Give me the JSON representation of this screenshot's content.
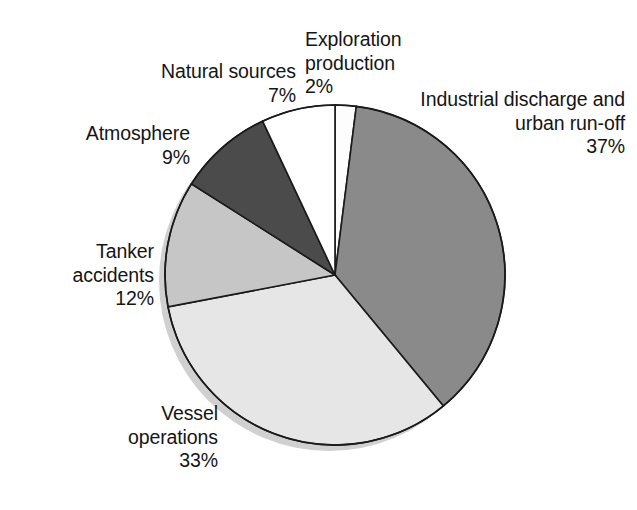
{
  "chart_data": {
    "type": "pie",
    "title": "",
    "subtitle": "",
    "xlabel": "",
    "ylabel": "",
    "grid": false,
    "legend_position": "none",
    "label_format": "name + percent",
    "start_angle_deg": 0,
    "direction": "clockwise",
    "units": "percent",
    "categories": [
      "Exploration production",
      "Industrial discharge and urban run-off",
      "Vessel operations",
      "Tanker accidents",
      "Atmosphere",
      "Natural sources"
    ],
    "values": [
      2,
      37,
      33,
      12,
      9,
      7
    ],
    "slices": [
      {
        "id": "exploration",
        "name_lines": [
          "Exploration",
          "production"
        ],
        "percent_text": "2%",
        "value": 2,
        "color": "#fdfdfd",
        "start_deg": 0,
        "end_deg": 7.2
      },
      {
        "id": "industrial",
        "name_lines": [
          "Industrial discharge and",
          "urban run-off"
        ],
        "percent_text": "37%",
        "value": 37,
        "color": "#8a8a8a",
        "start_deg": 7.2,
        "end_deg": 140.4
      },
      {
        "id": "vessel",
        "name_lines": [
          "Vessel",
          "operations"
        ],
        "percent_text": "33%",
        "value": 33,
        "color": "#e6e6e6",
        "start_deg": 140.4,
        "end_deg": 259.2
      },
      {
        "id": "tanker",
        "name_lines": [
          "Tanker",
          "accidents"
        ],
        "percent_text": "12%",
        "value": 12,
        "color": "#c6c6c6",
        "start_deg": 259.2,
        "end_deg": 302.4
      },
      {
        "id": "atmosphere",
        "name_lines": [
          "Atmosphere"
        ],
        "percent_text": "9%",
        "value": 9,
        "color": "#4b4b4b",
        "start_deg": 302.4,
        "end_deg": 334.8
      },
      {
        "id": "natural",
        "name_lines": [
          "Natural sources"
        ],
        "percent_text": "7%",
        "value": 7,
        "color": "#ffffff",
        "start_deg": 334.8,
        "end_deg": 360
      }
    ],
    "colors": {
      "outline": "#1a1a1a",
      "shadow": "#d0d0d0",
      "background": "#ffffff",
      "text": "#151515"
    }
  },
  "labels": {
    "exploration": {
      "line1": "Exploration",
      "line2": "production",
      "percent": "2%"
    },
    "industrial": {
      "line1": "Industrial discharge and",
      "line2": "urban run-off",
      "percent": "37%"
    },
    "vessel": {
      "line1": "Vessel",
      "line2": "operations",
      "percent": "33%"
    },
    "tanker": {
      "line1": "Tanker",
      "line2": "accidents",
      "percent": "12%"
    },
    "atmosphere": {
      "line1": "Atmosphere",
      "percent": "9%"
    },
    "natural": {
      "line1": "Natural sources",
      "percent": "7%"
    }
  }
}
